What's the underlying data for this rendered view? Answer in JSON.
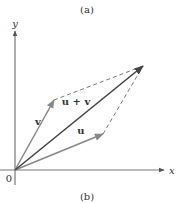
{
  "captions": {
    "top": "(a)",
    "bottom": "(b)"
  },
  "axes": {
    "x_label": "x",
    "y_label": "y",
    "origin_label": "0"
  },
  "vectors": {
    "u": {
      "label": "u",
      "tip": [
        103,
        134
      ]
    },
    "v": {
      "label": "v",
      "tip": [
        54,
        100
      ]
    },
    "sum": {
      "label": "u + v",
      "tip": [
        143,
        66
      ]
    }
  },
  "colors": {
    "axis": "#777777",
    "vector": "#888888",
    "sum": "#444444",
    "dashed": "#777777"
  }
}
